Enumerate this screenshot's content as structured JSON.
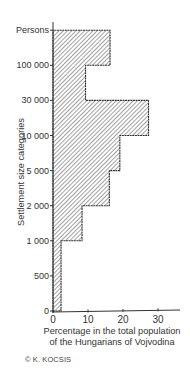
{
  "chart_data": {
    "type": "bar",
    "orientation": "horizontal-histogram",
    "title": "",
    "ylabel": "Settlement size categories",
    "xlabel": "Percentage in the total population of the Hungarians of Vojvodina",
    "xlabel_lines": [
      "Percentage in the total population",
      "of the Hungarians of Vojvodina"
    ],
    "y_tick_labels": [
      "0",
      "500",
      "1 000",
      "2 000",
      "5 000",
      "10 000",
      "30 000",
      "100 000",
      "Persons"
    ],
    "x_ticks": [
      0,
      10,
      20,
      30
    ],
    "xlim": [
      0,
      35
    ],
    "grid": false,
    "fill_pattern": "diagonal-hatch",
    "categories": [
      "0–500",
      "500–1 000",
      "1 000–2 000",
      "2 000–5 000",
      "5 000–10 000",
      "10 000–30 000",
      "30 000–100 000",
      "100 000+"
    ],
    "values": [
      2.3,
      2.3,
      8.3,
      16.1,
      19.1,
      27.3,
      9.3,
      16.3
    ]
  },
  "credit": "© K. KOCSIS"
}
